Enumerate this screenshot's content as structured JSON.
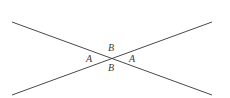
{
  "figure": {
    "background_color": "#ffffff",
    "line_color": "#4a4a4a",
    "label_color": "#3a3a3a",
    "canvas": {
      "width": 230,
      "height": 98
    }
  },
  "geometry": {
    "intersection": {
      "x": 114,
      "y": 58
    },
    "lines": [
      {
        "name": "line-descending",
        "description": "straight line from upper-left to lower-right",
        "x1": 12,
        "y1": 22,
        "x2": 212,
        "y2": 95
      },
      {
        "name": "line-ascending",
        "description": "straight line from lower-left to upper-right",
        "x1": 12,
        "y1": 95,
        "x2": 212,
        "y2": 22
      }
    ]
  },
  "labels": {
    "top": "B",
    "left": "A",
    "right": "A",
    "bottom": "B"
  }
}
